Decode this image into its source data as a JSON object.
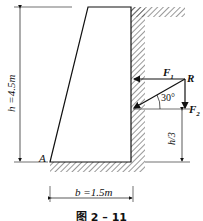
{
  "figure": {
    "caption": "图 2 – 11",
    "labels": {
      "height": "h =4.5m",
      "base": "b =1.5m",
      "point_a": "A",
      "force_1": "F",
      "force_1_sub": "1",
      "force_2": "F",
      "force_2_sub": "2",
      "resultant": "R",
      "angle": "30°",
      "third_height": "h/3"
    }
  }
}
